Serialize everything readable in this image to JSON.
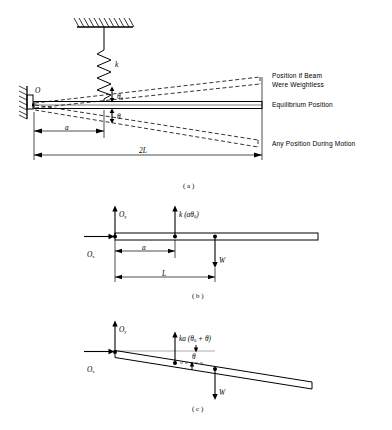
{
  "figure": {
    "panels": [
      {
        "caption": "( a )",
        "name": "physical-setup",
        "labels": {
          "pivot": "O",
          "spring_constant": "k",
          "theta_zero": "θ",
          "theta_zero_sub": "0",
          "theta": "θ",
          "dim_a": "a",
          "dim_2L": "2L"
        },
        "annotations": [
          "Position if Beam",
          "Were Weightless",
          "Equilibrium Position",
          "Any Position During Motion"
        ]
      },
      {
        "caption": "( b )",
        "name": "free-body-equilibrium",
        "labels": {
          "Oy": "O",
          "Oy_sub": "y",
          "Ox": "O",
          "Ox_sub": "x",
          "spring_force": "k (aθ",
          "spring_force_sub": "0",
          "spring_force_end": ")",
          "weight": "W",
          "dim_a": "a",
          "dim_L": "L"
        }
      },
      {
        "caption": "( c )",
        "name": "free-body-displaced",
        "labels": {
          "Oy": "O",
          "Oy_sub": "y",
          "Ox": "O",
          "Ox_sub": "x",
          "spring_force": "ka (θ",
          "spring_force_sub": "0",
          "spring_force_end": " + θ)",
          "weight": "W",
          "theta": "θ"
        }
      }
    ],
    "colors": {
      "ink": "#000000",
      "background": "#ffffff",
      "dashed": "#222222"
    }
  }
}
